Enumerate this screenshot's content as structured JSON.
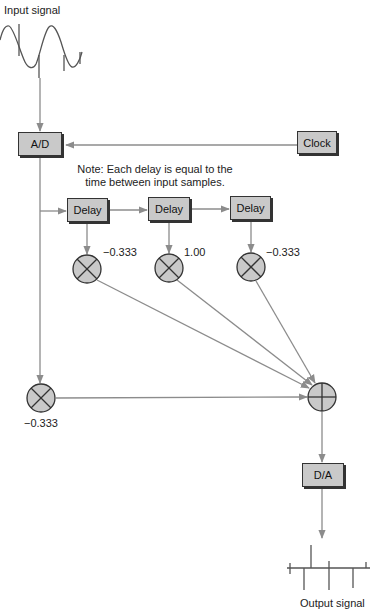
{
  "diagram": {
    "input_label": "Input signal",
    "output_label": "Output signal",
    "note_line1": "Note: Each delay is equal to the",
    "note_line2": "time between input samples.",
    "blocks": {
      "adc": "A/D",
      "clock": "Clock",
      "delay1": "Delay",
      "delay2": "Delay",
      "delay3": "Delay",
      "dac": "D/A"
    },
    "coefficients": {
      "tap0": "−0.333",
      "tap1": "−0.333",
      "tap2": "1.00",
      "tap3": "−0.333"
    },
    "icons": {
      "multiplier": "circle-x-multiplier-icon",
      "summer": "circle-plus-summer-icon"
    },
    "colors": {
      "block_fill": "#c9c9c9",
      "block_border": "#333333",
      "line": "#8c8c8c",
      "signal": "#555555"
    }
  }
}
